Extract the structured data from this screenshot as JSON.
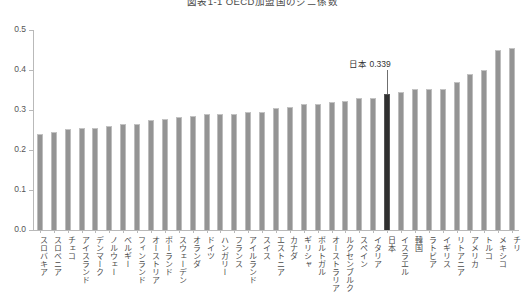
{
  "chart_data": {
    "type": "bar",
    "title": "図表1-1 OECD加盟国のジニ係数",
    "xlabel": "",
    "ylabel": "",
    "ylim": [
      0.0,
      0.5
    ],
    "yticks": [
      "0.0",
      "0.1",
      "0.2",
      "0.3",
      "0.4",
      "0.5"
    ],
    "ytick_values": [
      0.0,
      0.1,
      0.2,
      0.3,
      0.4,
      0.5
    ],
    "grid": false,
    "legend": "none",
    "categories": [
      "スロバキア",
      "スロベニア",
      "チェコ",
      "アイスランド",
      "デンマーク",
      "ノルウェー",
      "ベルギー",
      "フィンランド",
      "オーストリア",
      "ポーランド",
      "スウェーデン",
      "オランダ",
      "ドイツ",
      "ハンガリー",
      "フランス",
      "アイルランド",
      "スイス",
      "エストニア",
      "カナダ",
      "ギリシャ",
      "ポルトガル",
      "オーストラリア",
      "ルクセンブルク",
      "スペイン",
      "イタリア",
      "日本",
      "イスラエル",
      "韓国",
      "ラトビア",
      "イギリス",
      "リトアニア",
      "アメリカ",
      "トルコ",
      "メキシコ",
      "チリ"
    ],
    "values": [
      0.241,
      0.244,
      0.253,
      0.255,
      0.256,
      0.261,
      0.266,
      0.266,
      0.275,
      0.277,
      0.282,
      0.285,
      0.289,
      0.289,
      0.291,
      0.295,
      0.296,
      0.304,
      0.307,
      0.315,
      0.316,
      0.32,
      0.322,
      0.33,
      0.331,
      0.339,
      0.344,
      0.352,
      0.352,
      0.353,
      0.371,
      0.39,
      0.4,
      0.45,
      0.454
    ],
    "highlight_index": 25,
    "highlight_label": "日本",
    "highlight_value": "0.339",
    "annotation_text": "日本  0.339",
    "colors": {
      "bar": "#949494",
      "bar_edge": "#bdbdbd",
      "highlight_bar": "#303030",
      "axis": "#b9b9b9",
      "text": "#4a4a4a",
      "background": "#ffffff"
    }
  }
}
